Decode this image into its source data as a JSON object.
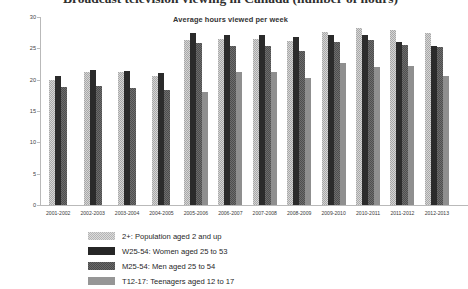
{
  "title": "Broadcast television viewing in Canada (number of hours)",
  "subtitle": "Average hours viewed per week",
  "axis": {
    "y_ticks": [
      "0",
      "5",
      "10",
      "15",
      "20",
      "25",
      "30"
    ],
    "ylim": [
      0,
      30
    ],
    "ylabel": "",
    "xlabel": ""
  },
  "legend": [
    {
      "key": "s0",
      "label": "2+: Population aged 2 and up",
      "color": "#b4b4b4"
    },
    {
      "key": "s1",
      "label": "W25-54: Women aged 25 to 53",
      "color": "#262626"
    },
    {
      "key": "s2",
      "label": "M25-54: Men aged 25 to 54",
      "color": "#4a4a4a"
    },
    {
      "key": "s3",
      "label": "T12-17: Teenagers aged 12 to 17",
      "color": "#969696"
    }
  ],
  "chart_data": {
    "type": "bar",
    "title": "Broadcast television viewing in Canada (number of hours)",
    "subtitle": "Average hours viewed per week",
    "xlabel": "",
    "ylabel": "Average hours viewed per week",
    "ylim": [
      0,
      30
    ],
    "ytick_step": 5,
    "grid": false,
    "legend_position": "bottom",
    "categories": [
      "2001-2002",
      "2002-2003",
      "2003-2004",
      "2004-2005",
      "2005-2006",
      "2006-2007",
      "2007-2008",
      "2008-2009",
      "2009-2010",
      "2010-2011",
      "2011-2012",
      "2012-2013"
    ],
    "series": [
      {
        "name": "2+: Population aged 2 and up",
        "key": "s0",
        "values": [
          20.0,
          21.3,
          21.2,
          20.6,
          26.4,
          26.5,
          26.5,
          26.1,
          27.6,
          28.2,
          27.9,
          27.5
        ]
      },
      {
        "name": "W25-54: Women aged 25 to 53",
        "key": "s1",
        "values": [
          20.6,
          21.6,
          21.4,
          21.0,
          27.4,
          27.1,
          27.1,
          26.8,
          27.2,
          27.2,
          26.0,
          25.4
        ]
      },
      {
        "name": "M25-54: Men aged 25 to 54",
        "key": "s2",
        "values": [
          18.9,
          19.0,
          18.7,
          18.4,
          25.9,
          25.3,
          25.3,
          24.6,
          26.0,
          26.3,
          25.5,
          25.2
        ]
      },
      {
        "name": "T12-17: Teenagers aged 12 to 17",
        "key": "s3",
        "values": [
          null,
          null,
          null,
          null,
          18.1,
          21.3,
          21.3,
          20.3,
          22.7,
          22.1,
          22.2,
          20.6
        ]
      }
    ]
  }
}
